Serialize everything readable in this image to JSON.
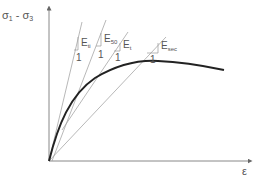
{
  "diagram": {
    "y_axis_label": {
      "main": "σ",
      "sub1": "1",
      "mid": " - σ",
      "sub2": "3"
    },
    "x_axis_label": "ε",
    "moduli": [
      {
        "name": "E",
        "sub": "ti",
        "slope_label": "1"
      },
      {
        "name": "E",
        "sub": "50",
        "slope_label": "1"
      },
      {
        "name": "E",
        "sub": "t",
        "slope_label": "1"
      },
      {
        "name": "E",
        "sub": "sec",
        "slope_label": "1"
      }
    ],
    "colors": {
      "curve": "#222222",
      "lines": "#888888",
      "axis": "#666666",
      "text": "#555555"
    }
  }
}
